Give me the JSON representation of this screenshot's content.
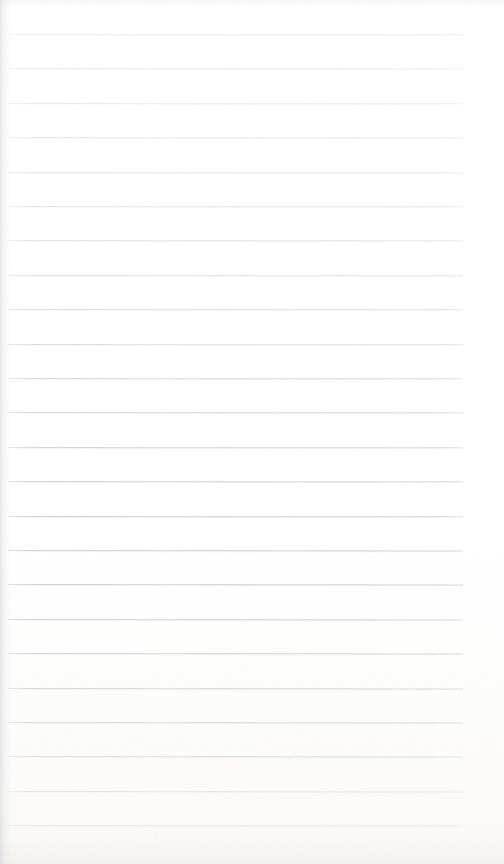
{
  "document": {
    "kind": "scanned-ruled-notepad-page",
    "title": "Blank Lined Notepad Page",
    "page_width": 504,
    "page_height": 864,
    "background_color": "#ffffff",
    "content_text": "",
    "is_blank": true
  },
  "ruling": {
    "line_count": 24,
    "first_line_y": 34,
    "line_spacing": 34.4,
    "line_start_x": 8,
    "line_end_x": 463,
    "line_thickness": 1,
    "top_margin": 34,
    "right_margin": 41,
    "left_margin": 8,
    "has_vertical_margin_rule": false,
    "color_top": "#e9ebed",
    "color_bottom": "#adb2ba",
    "note": "Rule darkness increases progressively from top to bottom due to scan illumination falloff."
  },
  "scan_artifacts": {
    "left_edge_shadow": "#c6c8cd",
    "bottom_warm_tint": "#f8f7f4",
    "grain_opacity": 0.5
  }
}
